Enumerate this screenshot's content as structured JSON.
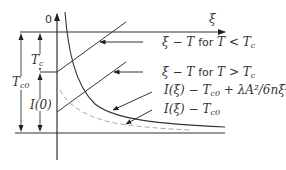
{
  "diagram": {
    "axes": {
      "vertical_label": "0",
      "horizontal_label": "ξ"
    },
    "dimensions": {
      "T_c": "T",
      "T_c_sub": "c",
      "T_c0": "T",
      "T_c0_sub": "c0",
      "I0": "I(0)"
    },
    "legend": [
      {
        "id": "xi-T-below",
        "math": "ξ − T",
        "word": "for",
        "cond": "T < T",
        "cond_sub": "c"
      },
      {
        "id": "xi-T-above",
        "math": "ξ − T",
        "word": "for",
        "cond": "T > T",
        "cond_sub": "c"
      },
      {
        "id": "I-corrected",
        "pre": "I(ξ) − T",
        "pre_sub": "c0",
        "post": " + λA²/6nξ²"
      },
      {
        "id": "I-plain",
        "pre": "I(ξ) − T",
        "pre_sub": "c0"
      }
    ],
    "colors": {
      "line": "#333333",
      "dashed": "#aaaaaa"
    }
  }
}
